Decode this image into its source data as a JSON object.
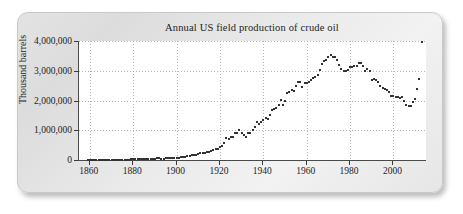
{
  "figure": {
    "frame_style": "rounded-gray-panel",
    "accent_color": "#333333",
    "plot_background": "#ffffff",
    "grid_color": "#b6b6b6",
    "axis_color": "#4a4a4a"
  },
  "chart_data": {
    "type": "scatter",
    "title": "Annual US field production of crude oil",
    "xlabel": "",
    "ylabel": "Thousand barrels",
    "xlim": [
      1855,
      2015
    ],
    "ylim": [
      0,
      4000000
    ],
    "grid": true,
    "legend": null,
    "xticks": [
      1860,
      1880,
      1900,
      1920,
      1940,
      1960,
      1980,
      2000
    ],
    "xtick_labels": [
      "1860",
      "1880",
      "1900",
      "1920",
      "1940",
      "1960",
      "1980",
      "2000"
    ],
    "yticks": [
      0,
      1000000,
      2000000,
      3000000,
      4000000
    ],
    "ytick_labels": [
      "0",
      "1,000,000",
      "2,000,000",
      "3,000,000",
      "4,000,000"
    ],
    "marker": "square",
    "marker_color": "#333333",
    "x": [
      1859,
      1860,
      1861,
      1862,
      1863,
      1864,
      1865,
      1866,
      1867,
      1868,
      1869,
      1870,
      1871,
      1872,
      1873,
      1874,
      1875,
      1876,
      1877,
      1878,
      1879,
      1880,
      1881,
      1882,
      1883,
      1884,
      1885,
      1886,
      1887,
      1888,
      1889,
      1890,
      1891,
      1892,
      1893,
      1894,
      1895,
      1896,
      1897,
      1898,
      1899,
      1900,
      1901,
      1902,
      1903,
      1904,
      1905,
      1906,
      1907,
      1908,
      1909,
      1910,
      1911,
      1912,
      1913,
      1914,
      1915,
      1916,
      1917,
      1918,
      1919,
      1920,
      1921,
      1922,
      1923,
      1924,
      1925,
      1926,
      1927,
      1928,
      1929,
      1930,
      1931,
      1932,
      1933,
      1934,
      1935,
      1936,
      1937,
      1938,
      1939,
      1940,
      1941,
      1942,
      1943,
      1944,
      1945,
      1946,
      1947,
      1948,
      1949,
      1950,
      1951,
      1952,
      1953,
      1954,
      1955,
      1956,
      1957,
      1958,
      1959,
      1960,
      1961,
      1962,
      1963,
      1964,
      1965,
      1966,
      1967,
      1968,
      1969,
      1970,
      1971,
      1972,
      1973,
      1974,
      1975,
      1976,
      1977,
      1978,
      1979,
      1980,
      1981,
      1982,
      1983,
      1984,
      1985,
      1986,
      1987,
      1988,
      1989,
      1990,
      1991,
      1992,
      1993,
      1994,
      1995,
      1996,
      1997,
      1998,
      1999,
      2000,
      2001,
      2002,
      2003,
      2004,
      2005,
      2006,
      2007,
      2008,
      2009,
      2010,
      2011,
      2012,
      2013
    ],
    "y": [
      2000,
      500,
      2114,
      3057,
      2611,
      2116,
      2498,
      3598,
      3347,
      3646,
      4215,
      5261,
      5205,
      6293,
      9894,
      10927,
      8788,
      9133,
      13350,
      15397,
      19914,
      26286,
      27661,
      30350,
      23450,
      24218,
      21859,
      28065,
      28283,
      27612,
      35164,
      45824,
      54293,
      50515,
      48431,
      49344,
      52892,
      60960,
      60476,
      55364,
      57071,
      63621,
      69389,
      88767,
      100461,
      117081,
      134717,
      126494,
      166095,
      178527,
      183171,
      209557,
      220449,
      222935,
      248446,
      265763,
      281104,
      300767,
      335316,
      355928,
      378367,
      442929,
      472183,
      557531,
      732407,
      713940,
      763743,
      770874,
      901129,
      901474,
      1007323,
      898011,
      851081,
      785159,
      905656,
      908065,
      996596,
      1099687,
      1279160,
      1214355,
      1264962,
      1353214,
      1402228,
      1386645,
      1505613,
      1677904,
      1713655,
      1733910,
      1856987,
      2020185,
      1841940,
      1973574,
      2247711,
      2289836,
      2357082,
      2314988,
      2484428,
      2617283,
      2616901,
      2448987,
      2574590,
      2574933,
      2621758,
      2676189,
      2752723,
      2786822,
      2848514,
      3027763,
      3215742,
      3329042,
      3371751,
      3453914,
      3517450,
      3453914,
      3455368,
      3360903,
      3202585,
      3056779,
      2976180,
      2985698,
      3009265,
      3121310,
      3128624,
      3170999,
      3157150,
      3248460,
      3274553,
      3168252,
      2978865,
      3046496,
      2979123,
      2684687,
      2707039,
      2684687,
      2624632,
      2499033,
      2431476,
      2394268,
      2354831,
      2281919,
      2146732,
      2145568,
      2117510,
      2130707,
      2097124,
      2116423,
      1983088,
      1862259,
      1830219,
      1830219,
      1954400,
      2064532,
      2374987,
      2719471
    ]
  }
}
